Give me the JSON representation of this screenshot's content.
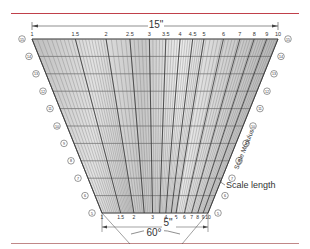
{
  "diagram": {
    "type": "nomogram-scale-fan",
    "top_dimension_label": "15\"",
    "bottom_dimension_label": "5\"",
    "angle_label": "60°",
    "annotation_label": "Scale length",
    "side_label": "Scale Modulus",
    "top_scale_ticks": [
      "1",
      "1.5",
      "2",
      "2.5",
      "3",
      "3.5",
      "4",
      "4.5",
      "5",
      "6",
      "7",
      "8",
      "9",
      "10"
    ],
    "bottom_scale_ticks": [
      "1",
      "1.5",
      "2",
      "3",
      "4",
      "5",
      "6",
      "7",
      "8",
      "9",
      "10"
    ],
    "row_markers": [
      "15",
      "14",
      "13",
      "12",
      "11",
      "10",
      "9",
      "8",
      "7",
      "6",
      "5"
    ],
    "colors": {
      "top_rule": "#c0404a",
      "bottom_rule": "#c08888",
      "lines": "#444444",
      "fill": "#d8d8d8"
    }
  }
}
